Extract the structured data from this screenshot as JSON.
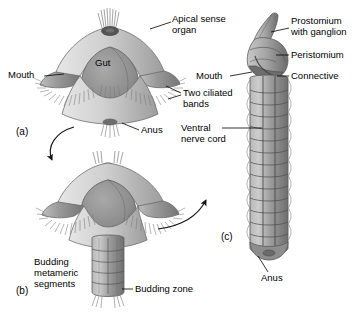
{
  "figure": {
    "background_color": "#ffffff",
    "line_color": "#000000",
    "tone_light": "#d8d8d8",
    "tone_mid": "#a8a8a8",
    "tone_dark": "#7b7b7b",
    "tone_darker": "#5f5f5f"
  },
  "panels": [
    {
      "id": "a",
      "label": "(a)",
      "x": 16,
      "y": 126,
      "caption": "trochophore larva"
    },
    {
      "id": "b",
      "label": "(b)",
      "x": 16,
      "y": 285,
      "caption": "budding metameric segments stage"
    },
    {
      "id": "c",
      "label": "(c)",
      "x": 221,
      "y": 231,
      "caption": "adult segmented worm"
    }
  ],
  "labels": {
    "apical_sense_organ": {
      "line1": "Apical sense",
      "line2": "organ"
    },
    "gut": "Gut",
    "mouth_a": "Mouth",
    "two_ciliated_bands": {
      "line1": "Two ciliated",
      "line2": "bands"
    },
    "anus_a": "Anus",
    "budding_metameric_segments": {
      "line1": "Budding",
      "line2": "metameric",
      "line3": "segments"
    },
    "budding_zone": "Budding zone",
    "prostomium_with_ganglion": {
      "line1": "Prostomium",
      "line2": "with ganglion"
    },
    "peristomium": "Peristomium",
    "connective": "Connective",
    "mouth_c": "Mouth",
    "ventral_nerve_cord": {
      "line1": "Ventral",
      "line2": "nerve cord"
    },
    "anus_c": "Anus"
  },
  "diagram_parts": {
    "larva_a": {
      "segment_count": 0,
      "ciliated_band_count": 2
    },
    "larva_b": {
      "budding_segment_count": 5
    },
    "worm_c": {
      "body_segment_count": 14,
      "nerve_cord_lines": 2
    }
  },
  "arrows": [
    {
      "name": "arrow-a-to-b",
      "from_panel": "a",
      "to_panel": "b",
      "direction": "down-right"
    },
    {
      "name": "arrow-b-to-c",
      "from_panel": "b",
      "to_panel": "c",
      "direction": "up-right"
    }
  ]
}
